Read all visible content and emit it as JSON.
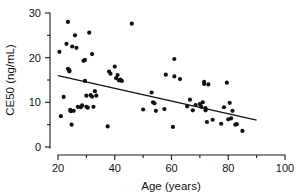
{
  "chart_data": {
    "type": "scatter",
    "title": "",
    "subtitle": "",
    "xlabel": "Age (years)",
    "ylabel": "CE50 (ng/mL)",
    "xlim": [
      20,
      100
    ],
    "ylim": [
      0,
      30
    ],
    "xticks": [
      20,
      40,
      60,
      80,
      100
    ],
    "yticks": [
      0,
      10,
      20,
      30
    ],
    "xtick_labels": [
      "20",
      "40",
      "60",
      "80",
      "100"
    ],
    "ytick_labels": [
      "0",
      "10",
      "20",
      "30"
    ],
    "grid": false,
    "legend": null,
    "legend_position": "none",
    "marker": "filled-circle",
    "marker_color": "#111111",
    "marker_size_px": 2.1,
    "annotations": [],
    "x": [
      20.5,
      21.0,
      22.0,
      23.0,
      23.5,
      23.5,
      24.0,
      24.0,
      24.3,
      24.5,
      24.8,
      25.0,
      25.5,
      26.0,
      26.5,
      27.0,
      28.0,
      28.5,
      29.0,
      29.5,
      29.5,
      30.0,
      30.0,
      30.5,
      31.0,
      31.5,
      32.0,
      32.0,
      32.5,
      33.0,
      33.5,
      37.5,
      38.0,
      38.5,
      40.0,
      40.5,
      41.0,
      41.5,
      42.0,
      42.5,
      46.0,
      50.0,
      53.0,
      53.5,
      54.0,
      54.5,
      57.5,
      58.0,
      60.5,
      61.0,
      61.0,
      63.0,
      65.5,
      66.5,
      67.5,
      68.5,
      70.0,
      70.5,
      71.0,
      71.5,
      71.5,
      72.0,
      72.0,
      72.5,
      73.0,
      74.5,
      77.5,
      78.5,
      79.5,
      80.0,
      80.5,
      81.0,
      81.5,
      82.5,
      83.0,
      85.0
    ],
    "y": [
      21.3,
      6.9,
      11.2,
      23.1,
      28.0,
      17.5,
      17.2,
      16.9,
      8.3,
      8.0,
      5.0,
      22.5,
      8.1,
      25.0,
      22.2,
      9.0,
      8.9,
      9.3,
      19.3,
      19.5,
      14.8,
      11.5,
      9.0,
      8.8,
      25.6,
      11.6,
      20.8,
      11.3,
      9.0,
      12.5,
      11.5,
      4.6,
      16.9,
      16.4,
      18.0,
      15.4,
      16.1,
      14.9,
      15.1,
      14.8,
      27.6,
      8.4,
      12.2,
      10.0,
      9.8,
      8.1,
      8.5,
      16.2,
      4.5,
      19.7,
      15.8,
      15.2,
      9.1,
      10.6,
      8.2,
      9.4,
      9.6,
      9.0,
      10.0,
      14.6,
      14.1,
      8.7,
      8.2,
      5.6,
      14.0,
      6.1,
      5.2,
      8.9,
      14.4,
      6.2,
      9.9,
      6.4,
      8.1,
      5.0,
      5.1,
      3.6
    ],
    "fit_line": {
      "type": "linear-regression",
      "x_start": 20,
      "y_start": 16.0,
      "x_end": 90,
      "y_end": 6.0,
      "color": "#111111"
    }
  }
}
